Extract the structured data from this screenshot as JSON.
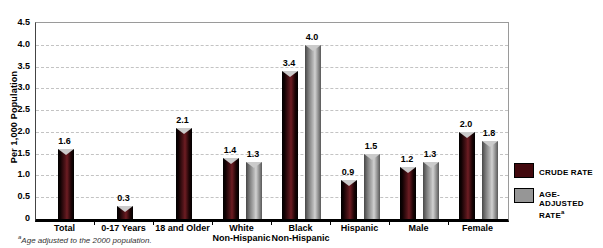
{
  "header": {
    "clipped_text": "CRUDE AND AGE-ADJUSTED RATES PER 1,000 POPULATION"
  },
  "chart_data": {
    "type": "bar",
    "title": "",
    "ylabel": "Per 1,000 Population",
    "xlabel": "",
    "ylim": [
      0,
      4.5
    ],
    "ytick_step": 0.5,
    "grid": "horizontal-dashed",
    "legend_position": "right",
    "categories": [
      "Total",
      "0-17 Years",
      "18 and Older",
      "White|Non-Hispanic",
      "Black|Non-Hispanic",
      "Hispanic",
      "Male",
      "Female"
    ],
    "series": [
      {
        "name": "CRUDE RATE",
        "color": "#42090e",
        "values": [
          1.6,
          0.3,
          2.1,
          1.4,
          3.4,
          0.9,
          1.2,
          2.0
        ]
      },
      {
        "name": "AGE-ADJUSTED RATE",
        "sup": "a",
        "color": "#969696",
        "values": [
          null,
          null,
          null,
          1.3,
          4.0,
          1.5,
          1.3,
          1.8
        ]
      }
    ]
  },
  "legend": {
    "items": [
      {
        "label": "CRUDE RATE",
        "sup": ""
      },
      {
        "label": "AGE-ADJUSTED RATE",
        "sup": "a"
      }
    ]
  },
  "footnote": {
    "sup": "a",
    "text": "Age adjusted to the 2000 population."
  }
}
